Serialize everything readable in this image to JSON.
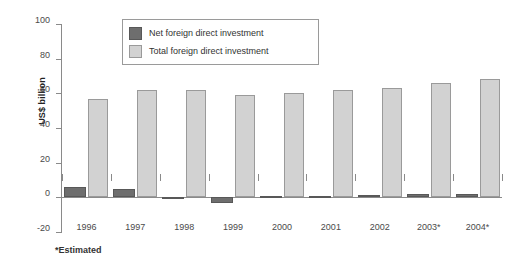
{
  "chart_data": {
    "type": "bar",
    "title": "",
    "subtitle": "",
    "xlabel": "",
    "ylabel": "US$ billion",
    "categories": [
      "1996",
      "1997",
      "1998",
      "1999",
      "2000",
      "2001",
      "2002",
      "2003*",
      "2004*"
    ],
    "series": [
      {
        "name": "Net foreign direct investment",
        "color": "#6e6e6e",
        "values": [
          6,
          5,
          -0.5,
          -3,
          1,
          0.5,
          1.2,
          2,
          2
        ]
      },
      {
        "name": "Total foreign direct investment",
        "color": "#d2d2d2",
        "values": [
          57,
          62,
          62,
          59,
          60,
          62,
          63,
          66,
          68
        ]
      }
    ],
    "ylim": [
      -20,
      100
    ],
    "yticks": [
      100,
      80,
      60,
      40,
      20,
      0,
      -20
    ],
    "ytick_labels": [
      "100",
      "80",
      "60",
      "40",
      "20",
      "0",
      "-20"
    ],
    "grid": false,
    "legend_position": "top-center",
    "annotations": [
      "*Estimated"
    ]
  },
  "footnote": "*Estimated",
  "axis": {
    "y_title": "US$ billion"
  }
}
